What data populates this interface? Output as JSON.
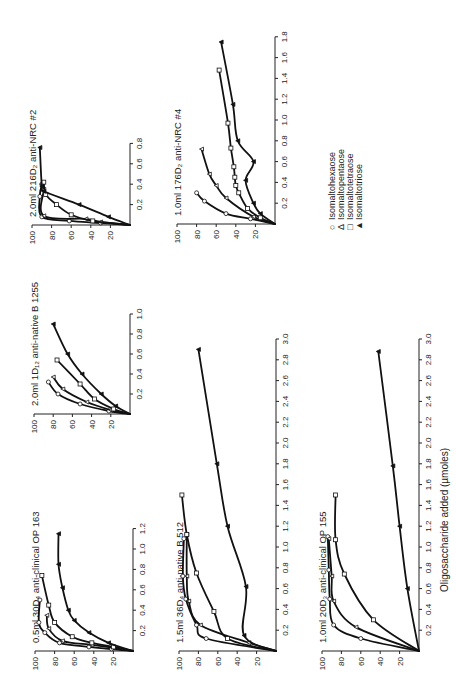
{
  "chart_data": [
    {
      "type": "line",
      "title": "2.0ml 216D₂ anti-NRC #2",
      "xlabel": "Oligosaccharide added (µmoles)",
      "ylabel": "% precipitation inhibited",
      "xlim": [
        0,
        0.8
      ],
      "ylim": [
        0,
        100
      ],
      "xticks": [
        "0.2",
        "0.4",
        "0.6",
        "0.8"
      ],
      "yticks": [
        "20",
        "40",
        "60",
        "80",
        "100"
      ],
      "series": [
        {
          "name": "Isomaltohexaose",
          "marker": "circle",
          "x": [
            0,
            0.02,
            0.04,
            0.08,
            0.28,
            0.4
          ],
          "y": [
            0,
            30,
            62,
            90,
            92,
            90
          ]
        },
        {
          "name": "Isomaltopentaose",
          "marker": "triangle-open",
          "x": [
            0,
            0.03,
            0.06,
            0.09,
            0.35,
            0.4
          ],
          "y": [
            0,
            30,
            45,
            88,
            88,
            90
          ]
        },
        {
          "name": "Isomaltotetraose",
          "marker": "square",
          "x": [
            0,
            0.04,
            0.1,
            0.2,
            0.3,
            0.42
          ],
          "y": [
            0,
            38,
            60,
            75,
            86,
            88
          ]
        },
        {
          "name": "Isomaltotriose",
          "marker": "triangle-filled",
          "x": [
            0,
            0.08,
            0.2,
            0.33,
            0.38,
            0.76
          ],
          "y": [
            0,
            22,
            52,
            88,
            90,
            92
          ]
        }
      ]
    },
    {
      "type": "line",
      "title": "1.0ml 176D₂ anti-NRC #4",
      "xlabel": "Oligosaccharide added (µmoles)",
      "xlim": [
        0,
        1.8
      ],
      "ylim": [
        0,
        100
      ],
      "xticks": [
        "0.2",
        "0.4",
        "0.6",
        "0.8",
        "1.0",
        "1.2",
        "1.4",
        "1.6",
        "1.8"
      ],
      "yticks": [
        "20",
        "40",
        "60",
        "80",
        "100"
      ],
      "series": [
        {
          "name": "Isomaltohexaose",
          "marker": "circle",
          "x": [
            0,
            0.05,
            0.1,
            0.22,
            0.3
          ],
          "y": [
            0,
            25,
            50,
            72,
            80
          ]
        },
        {
          "name": "Isomaltopentaose",
          "marker": "triangle-open",
          "x": [
            0,
            0.07,
            0.25,
            0.37,
            0.48,
            0.72
          ],
          "y": [
            0,
            22,
            50,
            60,
            67,
            75
          ]
        },
        {
          "name": "Isomaltotetraose",
          "marker": "square",
          "x": [
            0,
            0.06,
            0.15,
            0.3,
            0.37,
            0.45,
            0.55,
            0.73,
            0.97,
            1.48
          ],
          "y": [
            0,
            15,
            28,
            37,
            40,
            41,
            42,
            45,
            48,
            57
          ]
        },
        {
          "name": "Isomaltotriose",
          "marker": "triangle-filled",
          "x": [
            0,
            0.1,
            0.2,
            0.42,
            0.6,
            0.8,
            1.15,
            1.75
          ],
          "y": [
            0,
            15,
            22,
            30,
            22,
            38,
            43,
            55
          ]
        }
      ]
    },
    {
      "type": "line",
      "title": "2.0ml 1D₁₂ anti-native B 1255",
      "xlabel": "Oligosaccharide added (µmoles)",
      "xlim": [
        0,
        1.0
      ],
      "ylim": [
        0,
        100
      ],
      "xticks": [
        "0.2",
        "0.4",
        "0.6",
        "0.8",
        "1.0"
      ],
      "yticks": [
        "20",
        "40",
        "60",
        "80",
        "100"
      ],
      "series": [
        {
          "name": "Isomaltohexaose",
          "marker": "circle",
          "x": [
            0,
            0.03,
            0.1,
            0.2,
            0.32
          ],
          "y": [
            0,
            22,
            52,
            75,
            85
          ]
        },
        {
          "name": "Isomaltopentaose",
          "marker": "triangle-open",
          "x": [
            0,
            0.04,
            0.12,
            0.25,
            0.37
          ],
          "y": [
            0,
            20,
            45,
            70,
            80
          ]
        },
        {
          "name": "Isomaltotetraose",
          "marker": "square",
          "x": [
            0,
            0.05,
            0.15,
            0.3,
            0.54
          ],
          "y": [
            0,
            17,
            37,
            52,
            76
          ]
        },
        {
          "name": "Isomaltotriose",
          "marker": "triangle-filled",
          "x": [
            0,
            0.08,
            0.2,
            0.4,
            0.6,
            0.9
          ],
          "y": [
            0,
            15,
            30,
            50,
            65,
            80
          ]
        }
      ]
    },
    {
      "type": "line",
      "title": "0.5ml 30D₄ anti-clinical OP 163",
      "xlabel": "Oligosaccharide added (µmoles)",
      "xlim": [
        0,
        1.2
      ],
      "ylim": [
        0,
        100
      ],
      "xticks": [
        "0.2",
        "0.4",
        "0.6",
        "0.8",
        "1.0",
        "1.2"
      ],
      "yticks": [
        "20",
        "40",
        "60",
        "80",
        "100"
      ],
      "series": [
        {
          "name": "Isomaltohexaose",
          "marker": "circle",
          "x": [
            0,
            0.02,
            0.04,
            0.08,
            0.18,
            0.28,
            0.5
          ],
          "y": [
            0,
            22,
            45,
            75,
            90,
            96,
            95
          ]
        },
        {
          "name": "Isomaltopentaose",
          "marker": "triangle-open",
          "x": [
            0,
            0.03,
            0.06,
            0.1,
            0.22,
            0.35
          ],
          "y": [
            0,
            20,
            42,
            72,
            86,
            88
          ]
        },
        {
          "name": "Isomaltotetraose",
          "marker": "square",
          "x": [
            0,
            0.04,
            0.08,
            0.14,
            0.28,
            0.45,
            0.74
          ],
          "y": [
            0,
            20,
            42,
            62,
            80,
            86,
            93
          ]
        },
        {
          "name": "Isomaltotriose",
          "marker": "triangle-filled",
          "x": [
            0,
            0.08,
            0.18,
            0.3,
            0.4,
            0.62,
            0.85,
            1.15
          ],
          "y": [
            0,
            25,
            45,
            60,
            66,
            72,
            76,
            76
          ]
        }
      ]
    },
    {
      "type": "line",
      "title": "1.5ml 36D₄ anti-native B 512",
      "xlabel": "Oligosaccharide added (µmoles)",
      "xlim": [
        0,
        3.0
      ],
      "ylim": [
        0,
        100
      ],
      "xticks": [
        "0.2",
        "0.4",
        "0.6",
        "0.8",
        "1.0",
        "1.2",
        "1.4",
        "1.6",
        "1.8",
        "2.0",
        "2.2",
        "2.4",
        "2.6",
        "2.8",
        "3.0"
      ],
      "yticks": [
        "20",
        "40",
        "60",
        "80",
        "100"
      ],
      "series": [
        {
          "name": "Isomaltohexaose",
          "marker": "circle",
          "x": [
            0,
            0.12,
            0.25,
            0.5,
            0.72,
            1.08
          ],
          "y": [
            0,
            72,
            82,
            93,
            96,
            95
          ]
        },
        {
          "name": "Isomaltopentaose",
          "marker": "triangle-open",
          "x": [
            0,
            0.08,
            0.25,
            0.48,
            0.72,
            1.12
          ],
          "y": [
            0,
            28,
            78,
            90,
            92,
            92
          ]
        },
        {
          "name": "Isomaltotetraose",
          "marker": "square",
          "x": [
            0,
            0.12,
            0.38,
            0.75,
            1.12,
            1.5
          ],
          "y": [
            0,
            50,
            64,
            82,
            92,
            97
          ]
        },
        {
          "name": "Isomaltotriose",
          "marker": "triangle-filled",
          "x": [
            0,
            0.15,
            0.62,
            1.2,
            1.8,
            2.9
          ],
          "y": [
            0,
            33,
            31,
            50,
            61,
            80
          ]
        }
      ]
    },
    {
      "type": "line",
      "title": "1.0ml 20D₃ anti-clinical OP 155",
      "xlabel": "Oligosaccharide added (µmoles)",
      "xlim": [
        0,
        3.0
      ],
      "ylim": [
        0,
        100
      ],
      "xticks": [
        "0.2",
        "0.4",
        "0.6",
        "0.8",
        "1.0",
        "1.2",
        "1.4",
        "1.6",
        "1.8",
        "2.0",
        "2.2",
        "2.4",
        "2.6",
        "2.8",
        "3.0"
      ],
      "yticks": [
        "20",
        "40",
        "60",
        "80",
        "100"
      ],
      "series": [
        {
          "name": "Isomaltohexaose",
          "marker": "circle",
          "x": [
            0,
            0.12,
            0.25,
            0.5,
            0.78,
            1.1
          ],
          "y": [
            0,
            60,
            88,
            92,
            93,
            94
          ]
        },
        {
          "name": "Isomaltopentaose",
          "marker": "triangle-open",
          "x": [
            0,
            0.23,
            0.48,
            0.72,
            1.08
          ],
          "y": [
            0,
            65,
            88,
            90,
            93
          ]
        },
        {
          "name": "Isomaltotetraose",
          "marker": "square",
          "x": [
            0,
            0.3,
            0.74,
            1.07,
            1.5
          ],
          "y": [
            0,
            47,
            77,
            86,
            86
          ]
        },
        {
          "name": "Isomaltotriose",
          "marker": "triangle-filled",
          "x": [
            0,
            0.6,
            1.2,
            1.78,
            2.88
          ],
          "y": [
            0,
            12,
            20,
            27,
            42
          ]
        }
      ]
    }
  ],
  "legend": {
    "placement": "right",
    "items": [
      {
        "symbol": "○",
        "label": "Isomaltohexaose"
      },
      {
        "symbol": "Δ",
        "label": "Isomaltopentaose"
      },
      {
        "symbol": "□",
        "label": "Isomaltotetraose"
      },
      {
        "symbol": "▲",
        "label": "Isomaltotriose"
      }
    ]
  },
  "shared_xlabel": "Oligosaccharide added (µmoles)"
}
